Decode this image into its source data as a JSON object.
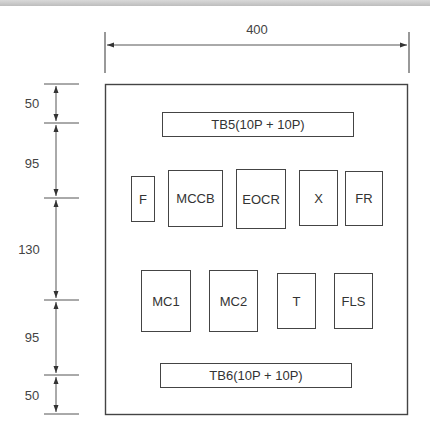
{
  "diagram": {
    "type": "panel layout drawing",
    "width_dimension": "400",
    "vertical_dimensions": [
      "50",
      "95",
      "130",
      "95",
      "50"
    ],
    "terminal_blocks": {
      "top": "TB5(10P + 10P)",
      "bottom": "TB6(10P + 10P)"
    },
    "row1_components": [
      "F",
      "MCCB",
      "EOCR",
      "X",
      "FR"
    ],
    "row2_components": [
      "MC1",
      "MC2",
      "T",
      "FLS"
    ]
  }
}
